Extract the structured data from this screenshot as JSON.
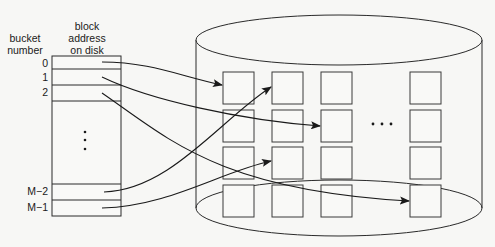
{
  "headers": {
    "bucket_number": [
      "bucket",
      "number"
    ],
    "block_address": [
      "block",
      "address",
      "on disk"
    ]
  },
  "bucket_table": {
    "rows": [
      {
        "label": "0",
        "target_block": "col1-row1"
      },
      {
        "label": "1",
        "target_block": "col3-row2"
      },
      {
        "label": "2",
        "target_block": "col4-row4"
      },
      {
        "label": "M−2",
        "target_block": "col2-row1"
      },
      {
        "label": "M−1",
        "target_block": "col2-row3"
      }
    ],
    "vertical_ellipsis": "⋮"
  },
  "disk": {
    "columns": 4,
    "rows": 4,
    "horizontal_ellipsis": "• • •"
  },
  "colors": {
    "line": "#2a2a2a",
    "background": "#f7f7f5",
    "box_fill": "#f9f9f7"
  }
}
